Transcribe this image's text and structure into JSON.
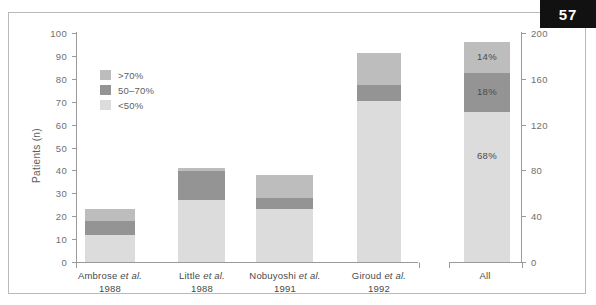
{
  "page": {
    "number": "57"
  },
  "chart_data": {
    "type": "bar",
    "subtype": "stacked-bar",
    "title": "",
    "xlabel": "",
    "ylabel": "Patients (n)",
    "ylim": [
      0,
      100
    ],
    "ytick_labels": [
      "100",
      "90",
      "80",
      "70",
      "60",
      "50",
      "40",
      "30",
      "20",
      "10",
      "0"
    ],
    "yticks": [
      100,
      90,
      80,
      70,
      60,
      50,
      40,
      30,
      20,
      10,
      0
    ],
    "y2label": "",
    "y2lim": [
      0,
      200
    ],
    "y2tick_labels": [
      "200",
      "160",
      "120",
      "80",
      "40",
      "0"
    ],
    "y2ticks": [
      200,
      160,
      120,
      80,
      40,
      0
    ],
    "grid": false,
    "legend_position": "upper-left-inside",
    "legend": [
      {
        "label": ">70%",
        "color": "#bdbdbd"
      },
      {
        "label": "50–70%",
        "color": "#949494"
      },
      {
        "label": "<50%",
        "color": "#dcdcdc"
      }
    ],
    "categories": [
      {
        "name": "Ambrose et al.",
        "year": "1988",
        "axis": "left"
      },
      {
        "name": "Little et al.",
        "year": "1988",
        "axis": "left"
      },
      {
        "name": "Nobuyoshi et al.",
        "year": "1991",
        "axis": "left"
      },
      {
        "name": "Giroud et al.",
        "year": "1992",
        "axis": "left"
      },
      {
        "name": "All",
        "year": "",
        "axis": "right"
      }
    ],
    "series": [
      {
        "name": "<50%",
        "color": "#dcdcdc",
        "values": [
          12,
          27,
          23,
          70,
          136
        ]
      },
      {
        "name": "50–70%",
        "color": "#949494",
        "values": [
          6,
          13,
          5,
          7,
          36
        ]
      },
      {
        "name": ">70%",
        "color": "#bdbdbd",
        "values": [
          5,
          1,
          10,
          14,
          28
        ]
      }
    ],
    "totals": [
      23,
      41,
      38,
      91,
      200
    ],
    "data_labels": {
      "All": {
        "gt70": "14%",
        "mid": "18%",
        "lt50": "68%"
      }
    },
    "annotations": [
      "14%",
      "18%",
      "68%"
    ]
  }
}
